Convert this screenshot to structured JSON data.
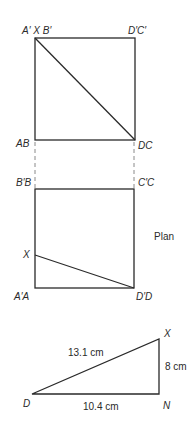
{
  "elevation": {
    "labels": {
      "top_left": "A′ X B′",
      "top_right": "D′C′",
      "bottom_left": "AB",
      "bottom_right": "DC"
    }
  },
  "plan": {
    "title": "Plan",
    "labels": {
      "top_left": "B′B",
      "top_right": "C′C",
      "point_x": "X",
      "bottom_left": "A′A",
      "bottom_right": "D′D"
    }
  },
  "triangle": {
    "vertices": {
      "d": "D",
      "x": "X",
      "n": "N"
    },
    "sides": {
      "hypotenuse": "13.1 cm",
      "base": "10.4 cm",
      "height": "8 cm"
    }
  }
}
